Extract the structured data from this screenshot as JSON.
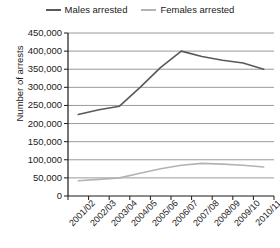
{
  "chart_data": {
    "type": "line",
    "title": "",
    "xlabel": "",
    "ylabel": "Number of arrests",
    "ylim": [
      0,
      450000
    ],
    "ytick_step": 50000,
    "ytick_labels": [
      "450,000",
      "400,000",
      "350,000",
      "300,000",
      "250,000",
      "200,000",
      "150,000",
      "100,000",
      "50,000",
      "0"
    ],
    "ytick_values": [
      450000,
      400000,
      350000,
      300000,
      250000,
      200000,
      150000,
      100000,
      50000,
      0
    ],
    "grid": true,
    "legend_position": "top-center",
    "categories": [
      "2001/02",
      "2002/03",
      "2003/04",
      "2004/05",
      "2005/06",
      "2006/07",
      "2007/08",
      "2008/09",
      "2009/10",
      "2010/11"
    ],
    "series": [
      {
        "name": "Males arrested",
        "color": "#595959",
        "values": [
          225000,
          238000,
          248000,
          300000,
          355000,
          400000,
          385000,
          375000,
          367000,
          350000
        ]
      },
      {
        "name": "Females arrested",
        "color": "#b3b3b3",
        "values": [
          42000,
          46000,
          50000,
          63000,
          75000,
          85000,
          90000,
          88000,
          85000,
          80000
        ]
      }
    ]
  },
  "colors": {
    "axis": "#1a1a1a",
    "grid": "#808080",
    "background": "#ffffff"
  }
}
